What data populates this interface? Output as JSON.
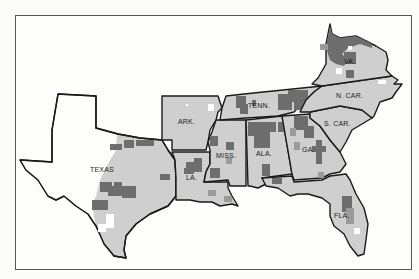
{
  "map": {
    "type": "choropleth",
    "region": "Southern United States (Confederate states)",
    "shading": {
      "unshaded": "#fdfdfb",
      "light": "#cfcfcf",
      "medium": "#9a9a9a",
      "dark": "#6e6e6e"
    },
    "labels": {
      "texas": "TEXAS",
      "arkansas": "ARK.",
      "louisiana": "LA.",
      "mississippi": "MISS.",
      "alabama": "ALA.",
      "tennessee": "TENN.",
      "georgia": "GA.",
      "florida": "FLA.",
      "south_carolina": "S. CAR.",
      "north_carolina": "N. CAR.",
      "virginia": "VA."
    }
  }
}
